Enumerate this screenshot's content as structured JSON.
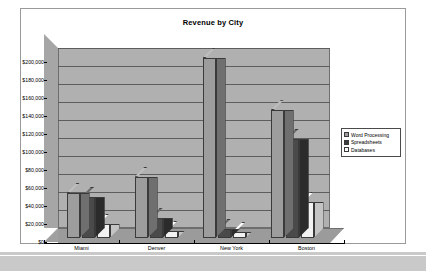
{
  "document": {
    "background_color": "#c9c9c9",
    "page_color": "#ffffff",
    "border_color": "#9a9a9a"
  },
  "chart_data": {
    "type": "bar",
    "title": "Revenue by City",
    "xlabel": "",
    "ylabel": "",
    "categories": [
      "Miami",
      "Denver",
      "New York",
      "Boston"
    ],
    "series": [
      {
        "name": "Word Processing",
        "color": "#9d9d9d",
        "values": [
          50000,
          68000,
          200000,
          142000
        ]
      },
      {
        "name": "Spreadsheets",
        "color": "#3c3c3c",
        "values": [
          46000,
          22000,
          10000,
          110000
        ]
      },
      {
        "name": "Databases",
        "color": "#fafafa",
        "values": [
          16000,
          8000,
          7000,
          40000
        ]
      }
    ],
    "ylim": [
      0,
      200000
    ],
    "ytick_values": [
      0,
      20000,
      40000,
      60000,
      80000,
      100000,
      120000,
      140000,
      160000,
      180000,
      200000
    ],
    "ytick_labels": [
      "$0",
      "$20,000",
      "$40,000",
      "$60,000",
      "$80,000",
      "$100,000",
      "$120,000",
      "$140,000",
      "$160,000",
      "$180,000",
      "$200,000"
    ],
    "grid": true,
    "legend_position": "right",
    "three_d": true,
    "plot_background": "#b0b0b0"
  },
  "legend": {
    "items": [
      {
        "label": "Word Processing"
      },
      {
        "label": "Spreadsheets"
      },
      {
        "label": "Databases"
      }
    ]
  }
}
